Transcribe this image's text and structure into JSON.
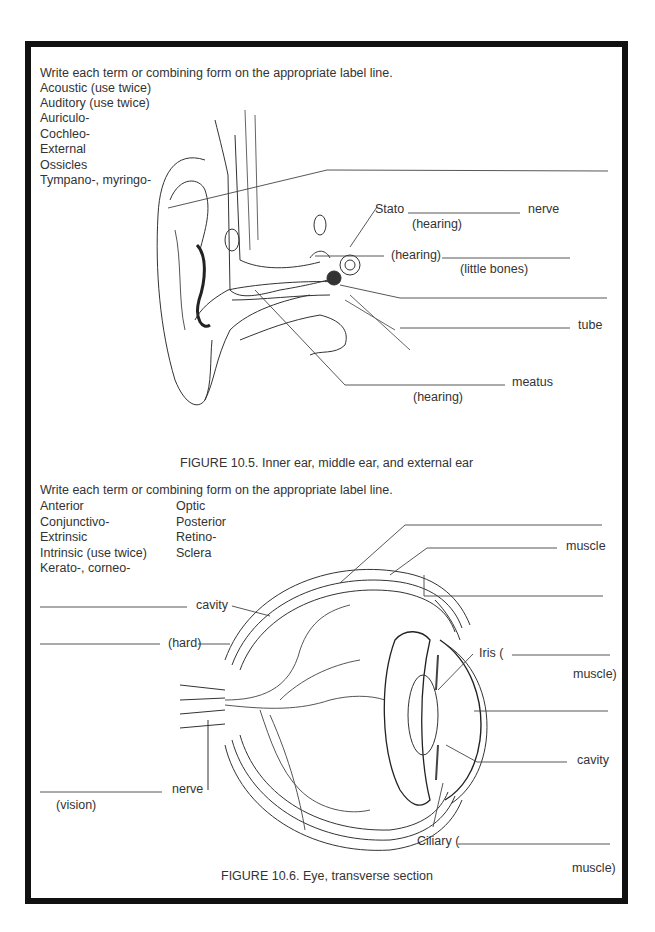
{
  "ear_section": {
    "instruction": "Write each term or combining form on the appropriate label line.",
    "terms": [
      "Acoustic (use twice)",
      "Auditory (use twice)",
      "Auriculo-",
      "Cochleo-",
      "External",
      "Ossicles",
      "Tympano-, myringo-"
    ],
    "labels": {
      "stato": "Stato",
      "nerve": "nerve",
      "hearing_1": "(hearing)",
      "hearing_2": "(hearing)",
      "little_bones": "(little bones)",
      "tube": "tube",
      "meatus": "meatus",
      "hearing_3": "(hearing)"
    },
    "caption": "FIGURE 10.5. Inner ear, middle ear, and external ear"
  },
  "eye_section": {
    "instruction": "Write each term or combining form on the appropriate label line.",
    "terms_col1": [
      "Anterior",
      "Conjunctivo-",
      "Extrinsic",
      "Intrinsic (use twice)",
      "Kerato-, corneo-"
    ],
    "terms_col2": [
      "Optic",
      "Posterior",
      "Retino-",
      "Sclera"
    ],
    "labels": {
      "cavity_left": "cavity",
      "hard": "(hard)",
      "nerve": "nerve",
      "vision": "(vision)",
      "muscle_top": "muscle",
      "iris": "Iris (",
      "iris_muscle": "muscle)",
      "cavity_right": "cavity",
      "ciliary": "Ciliary (",
      "ciliary_muscle": "muscle)"
    },
    "caption": "FIGURE 10.6. Eye, transverse section"
  }
}
